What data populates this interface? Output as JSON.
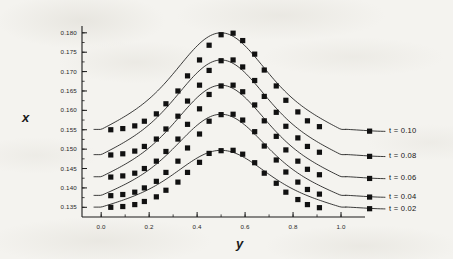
{
  "chart_data": {
    "type": "line",
    "title": "",
    "subtitle": "",
    "xlabel": "y",
    "ylabel": "x",
    "xlim": [
      -0.08,
      1.1
    ],
    "ylim": [
      0.1325,
      0.1815
    ],
    "xticks": [
      "0.0",
      "0.2",
      "0.4",
      "0.6",
      "0.8",
      "1.0"
    ],
    "xtick_values": [
      0.0,
      0.2,
      0.4,
      0.6,
      0.8,
      1.0
    ],
    "yticks": [
      "0.180",
      "0.175",
      "0.170",
      "0.165",
      "0.160",
      "0.155",
      "0.150",
      "0.145",
      "0.140",
      "0.135"
    ],
    "ytick_values": [
      0.18,
      0.175,
      0.17,
      0.165,
      0.16,
      0.155,
      0.15,
      0.145,
      0.14,
      0.135
    ],
    "x_minor_tick_step": 0.1,
    "y_minor_tick_step": 0.0025,
    "grid": false,
    "legend_position": "right-inline",
    "marker": "filled-square",
    "line_color": "#1a1a1a",
    "marker_color": "#111111",
    "background_color": "#f4f3ef",
    "x": [
      0.04,
      0.09,
      0.14,
      0.18,
      0.23,
      0.27,
      0.32,
      0.36,
      0.41,
      0.45,
      0.5,
      0.55,
      0.59,
      0.64,
      0.68,
      0.73,
      0.77,
      0.82,
      0.86,
      0.91
    ],
    "series": [
      {
        "name": "t = 0.10",
        "label": "t = 0.10",
        "baseline": 0.155,
        "peak": 0.18,
        "values": [
          0.155,
          0.1553,
          0.156,
          0.1572,
          0.1591,
          0.1617,
          0.165,
          0.1689,
          0.173,
          0.1768,
          0.1795,
          0.1799,
          0.178,
          0.1745,
          0.1704,
          0.1663,
          0.1626,
          0.1596,
          0.1573,
          0.1558
        ]
      },
      {
        "name": "t = 0.08",
        "label": "t = 0.08",
        "baseline": 0.1485,
        "peak": 0.173,
        "values": [
          0.1485,
          0.1488,
          0.1495,
          0.1507,
          0.1526,
          0.1552,
          0.1585,
          0.1624,
          0.1665,
          0.1703,
          0.1728,
          0.173,
          0.1712,
          0.1677,
          0.1636,
          0.1595,
          0.1559,
          0.1529,
          0.1507,
          0.1492
        ]
      },
      {
        "name": "t = 0.06",
        "label": "t = 0.06",
        "baseline": 0.1428,
        "peak": 0.1665,
        "values": [
          0.1428,
          0.1431,
          0.1438,
          0.145,
          0.1469,
          0.1494,
          0.1526,
          0.1564,
          0.1604,
          0.1641,
          0.1663,
          0.1665,
          0.1648,
          0.1614,
          0.1573,
          0.1533,
          0.1498,
          0.1469,
          0.1448,
          0.1434
        ]
      },
      {
        "name": "t = 0.04",
        "label": "t = 0.04",
        "baseline": 0.138,
        "peak": 0.159,
        "values": [
          0.138,
          0.1383,
          0.1389,
          0.14,
          0.1417,
          0.144,
          0.1469,
          0.1503,
          0.1539,
          0.1572,
          0.1589,
          0.159,
          0.1575,
          0.1545,
          0.1508,
          0.1472,
          0.1441,
          0.1415,
          0.1396,
          0.1384
        ]
      },
      {
        "name": "t = 0.02",
        "label": "t = 0.02",
        "baseline": 0.135,
        "peak": 0.1497,
        "values": [
          0.135,
          0.1352,
          0.1357,
          0.1365,
          0.1377,
          0.1394,
          0.1415,
          0.144,
          0.1466,
          0.1489,
          0.1496,
          0.1497,
          0.1487,
          0.1465,
          0.1438,
          0.1412,
          0.1389,
          0.137,
          0.1357,
          0.1349
        ]
      }
    ]
  }
}
